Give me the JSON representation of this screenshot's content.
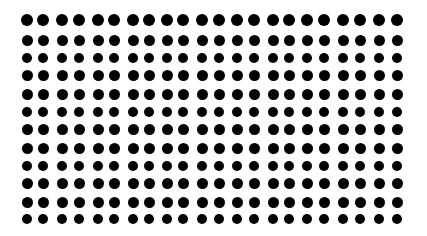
{
  "pattern": {
    "description": "Grid of black dots on white background",
    "background_color": "#ffffff",
    "dot_color": "#000000",
    "dot_diameter": 11,
    "rows": 12,
    "columns": 22,
    "column_centers_x": [
      27,
      43,
      62,
      79,
      98,
      114,
      133,
      149,
      167,
      183,
      202,
      219,
      237,
      254,
      273,
      289,
      307,
      324,
      343,
      360,
      379,
      397
    ],
    "row_centers_y": [
      20,
      40,
      58,
      75,
      94,
      112,
      129,
      148,
      166,
      183,
      202,
      219
    ],
    "row_dot_diameters": [
      12,
      11,
      10,
      11,
      11,
      10,
      11,
      11,
      10,
      11,
      11,
      10
    ]
  }
}
